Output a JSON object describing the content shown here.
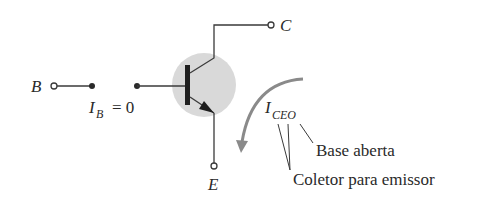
{
  "diagram": {
    "terminals": {
      "base": "B",
      "collector": "C",
      "emitter": "E"
    },
    "base_current": {
      "symbol": "I",
      "subscript": "B",
      "equals": "= 0"
    },
    "leakage_current": {
      "symbol": "I",
      "subscript": "CEO"
    },
    "annotations": {
      "open_base": "Base aberta",
      "collector_to_emitter": "Coletor para emissor"
    },
    "colors": {
      "wire": "#3a3a3a",
      "transistor_body": "#d9d9d9",
      "current_arrow": "#8a8a8a",
      "text": "#2a2a2a"
    }
  }
}
